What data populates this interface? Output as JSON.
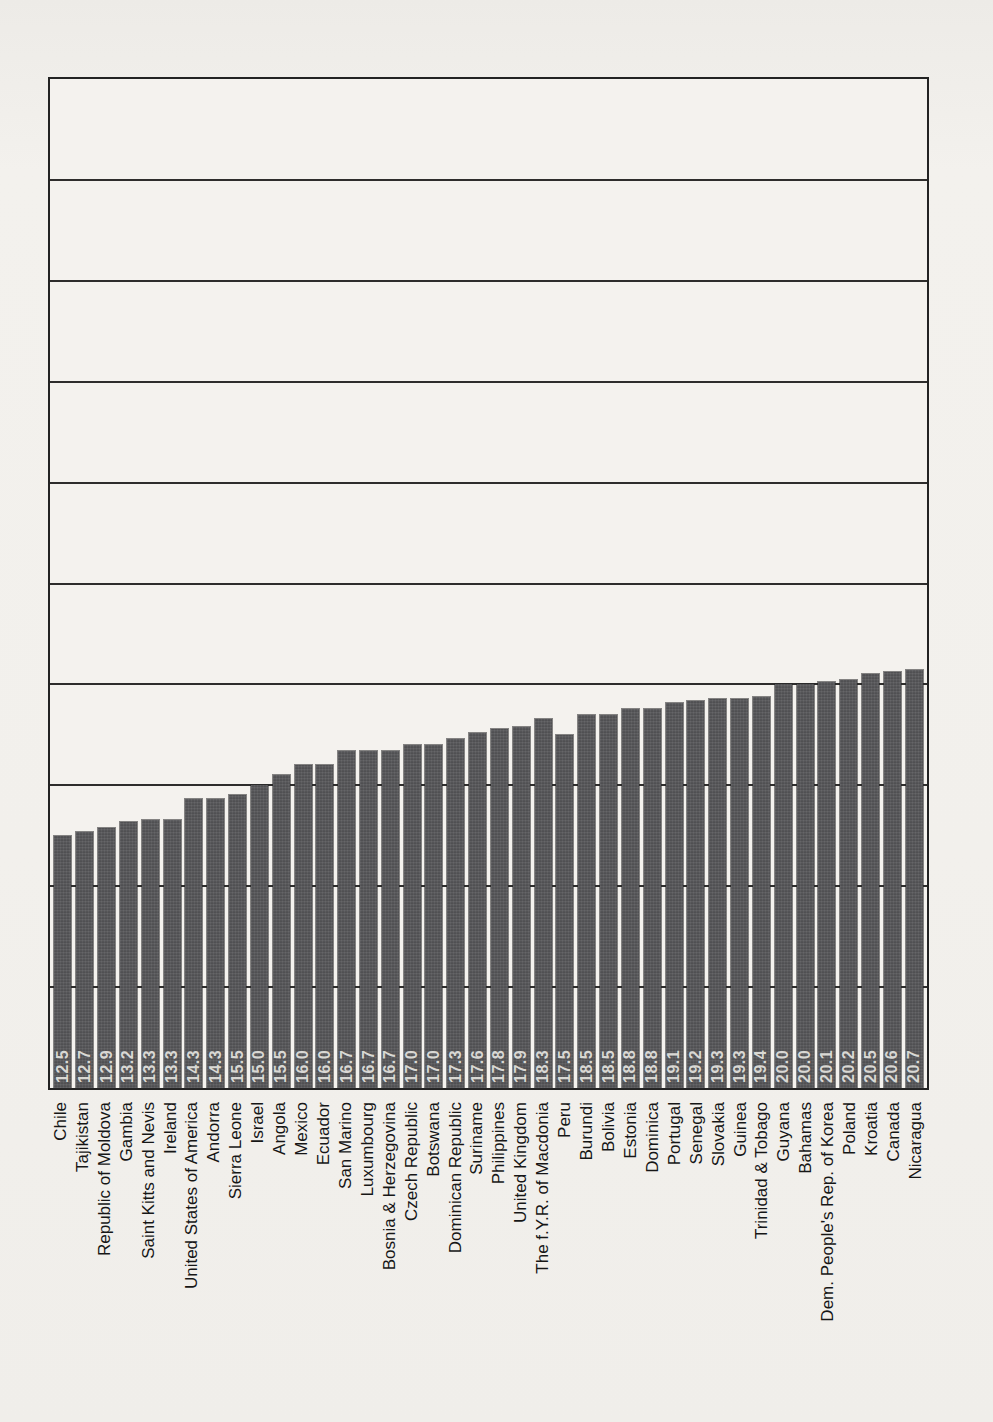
{
  "page": {
    "background_color": "#f1efeb",
    "frame_color": "#232323",
    "gridline_color": "#2e2d2c",
    "bar_color": "#57575a",
    "bar_value_text_color": "#d9d8d4",
    "country_label_color": "#161616"
  },
  "chart_data": {
    "type": "bar",
    "orientation": "vertical-bars",
    "title": "",
    "xlabel": "",
    "ylabel": "",
    "ylim": [
      0,
      50
    ],
    "gridline_interval": 5,
    "grid": "horizontal",
    "legend": "none",
    "y_tick_labels_visible": false,
    "value_label_style": "printed in light gray at bar base, rotated 90°, one decimal",
    "category_label_style": "rotated 90°, reading bottom-to-top, below axis",
    "categories": [
      "Chile",
      "Tajikistan",
      "Republic of Moldova",
      "Gambia",
      "Saint Kitts and Nevis",
      "Ireland",
      "United States of America",
      "Andorra",
      "Sierra Leone",
      "Israel",
      "Angola",
      "Mexico",
      "Ecuador",
      "San Marino",
      "Luxumbourg",
      "Bosnia & Herzegovina",
      "Czech Republic",
      "Botswana",
      "Dominican Republic",
      "Suriname",
      "Philippines",
      "United Kingdom",
      "The f.Y.R. of Macdonia",
      "Peru",
      "Burundi",
      "Bolivia",
      "Estonia",
      "Dominica",
      "Portugal",
      "Senegal",
      "Slovakia",
      "Guinea",
      "Trinidad & Tobago",
      "Guyana",
      "Bahamas",
      "Dem. People's Rep. of Korea",
      "Poland",
      "Kroatia",
      "Canada",
      "Nicaragua"
    ],
    "values": [
      "12.5",
      "12.7",
      "12.9",
      "13.2",
      "13.3",
      "13.3",
      "14.3",
      "14.3",
      "15.5",
      "15.0",
      "15.5",
      "16.0",
      "16.0",
      "16.7",
      "16.7",
      "16.7",
      "17.0",
      "17.0",
      "17.3",
      "17.6",
      "17.8",
      "17.9",
      "18.3",
      "17.5",
      "18.5",
      "18.5",
      "18.8",
      "18.8",
      "19.1",
      "19.2",
      "19.3",
      "19.3",
      "19.4",
      "20.0",
      "20.0",
      "20.1",
      "20.2",
      "20.5",
      "20.6",
      "20.7"
    ],
    "bar_heights_as_drawn": [
      12.5,
      12.7,
      12.9,
      13.2,
      13.3,
      13.3,
      14.3,
      14.3,
      14.5,
      15.0,
      15.5,
      16.0,
      16.0,
      16.7,
      16.7,
      16.7,
      17.0,
      17.0,
      17.3,
      17.6,
      17.8,
      17.9,
      18.3,
      17.5,
      18.5,
      18.5,
      18.8,
      18.8,
      19.1,
      19.2,
      19.3,
      19.3,
      19.4,
      20.0,
      20.0,
      20.1,
      20.2,
      20.5,
      20.6,
      20.7
    ]
  }
}
